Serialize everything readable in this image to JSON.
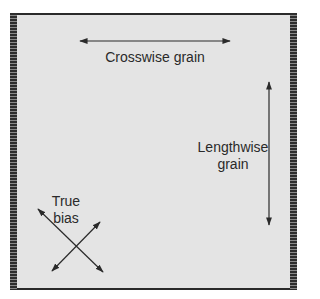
{
  "diagram": {
    "labels": {
      "crosswise": "Crosswise grain",
      "lengthwise_line1": "Lengthwise",
      "lengthwise_line2": "grain",
      "bias_line1": "True",
      "bias_line2": "bias"
    },
    "colors": {
      "fabric": "#e4e4e4",
      "ink": "#2a2a2a",
      "selvage_dark": "#2e2e2e",
      "selvage_light": "#8a8a8a"
    },
    "arrows": [
      {
        "name": "crosswise-grain-arrow",
        "x1": 80,
        "y1": 41,
        "x2": 230,
        "y2": 41
      },
      {
        "name": "lengthwise-grain-arrow",
        "x1": 269,
        "y1": 82,
        "x2": 269,
        "y2": 225
      },
      {
        "name": "bias-arrow-1",
        "x1": 38,
        "y1": 209,
        "x2": 103,
        "y2": 272
      },
      {
        "name": "bias-arrow-2",
        "x1": 100,
        "y1": 222,
        "x2": 52,
        "y2": 271
      }
    ]
  }
}
